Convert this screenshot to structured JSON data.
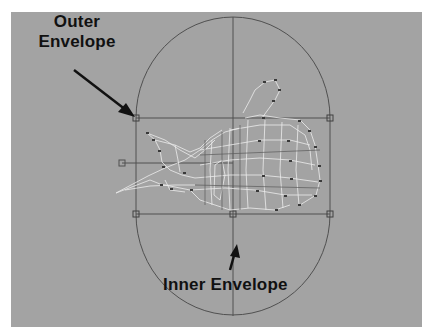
{
  "viewport": {
    "background": "#a3a3a3",
    "line_color": "#4a4a4a",
    "wire_color": "#e8e8e8"
  },
  "annotations": {
    "outer_line1": "Outer",
    "outer_line2": "Envelope",
    "inner": "Inner Envelope"
  }
}
